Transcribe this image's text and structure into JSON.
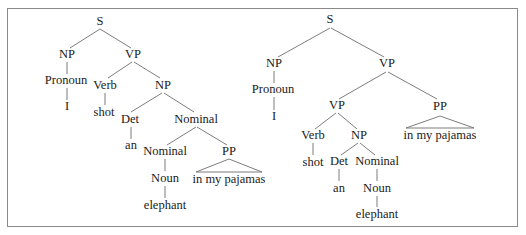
{
  "figure": {
    "left_tree": {
      "attachment": "PP attached to Nominal (elephant in pajamas)",
      "nodes": {
        "S": "S",
        "NP": "NP",
        "VP": "VP",
        "Pronoun": "Pronoun",
        "I": "I",
        "Verb": "Verb",
        "shot": "shot",
        "NP2": "NP",
        "Det": "Det",
        "an": "an",
        "Nominal": "Nominal",
        "Nominal2": "Nominal",
        "PP": "PP",
        "Noun": "Noun",
        "elephant": "elephant",
        "pp_text": "in my pajamas"
      }
    },
    "right_tree": {
      "attachment": "PP attached to VP (shooting in pajamas)",
      "nodes": {
        "S": "S",
        "NP": "NP",
        "VP": "VP",
        "Pronoun": "Pronoun",
        "I": "I",
        "VP2": "VP",
        "PP": "PP",
        "pp_text": "in my pajamas",
        "Verb": "Verb",
        "shot": "shot",
        "NP2": "NP",
        "Det": "Det",
        "an": "an",
        "Nominal": "Nominal",
        "Noun": "Noun",
        "elephant": "elephant"
      }
    }
  }
}
